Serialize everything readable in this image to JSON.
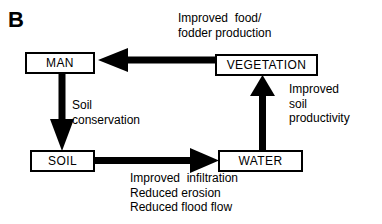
{
  "figure": {
    "panel_label": "B",
    "background_color": "#ffffff",
    "stroke_color": "#000000",
    "width": 382,
    "height": 224
  },
  "nodes": [
    {
      "id": "man",
      "label": "MAN"
    },
    {
      "id": "vegetation",
      "label": "VEGETATION"
    },
    {
      "id": "soil",
      "label": "SOIL"
    },
    {
      "id": "water",
      "label": "WATER"
    }
  ],
  "annotations": {
    "food": "Improved  food/\nfodder production",
    "soil_conservation": "Soil\nconservation",
    "soil_productivity": "Improved\nsoil\nproductivity",
    "infiltration": "Improved  infiltration\nReduced erosion\nReduced flood flow"
  },
  "diagram_data": {
    "type": "diagram",
    "orientation": "cycle",
    "edges": [
      {
        "from": "vegetation",
        "to": "man",
        "direction": "left",
        "label": "Improved  food/ fodder production"
      },
      {
        "from": "man",
        "to": "soil",
        "direction": "down",
        "label": "Soil conservation"
      },
      {
        "from": "soil",
        "to": "water",
        "direction": "right",
        "label": "Improved  infiltration / Reduced erosion / Reduced flood flow"
      },
      {
        "from": "water",
        "to": "vegetation",
        "direction": "up",
        "label": "Improved soil productivity"
      }
    ]
  }
}
